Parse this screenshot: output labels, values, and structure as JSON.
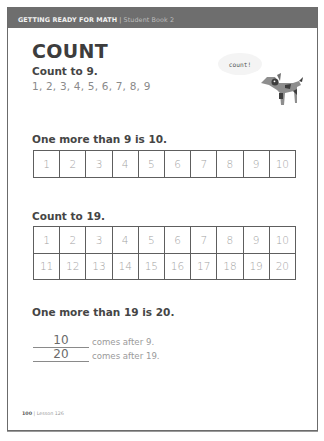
{
  "header": {
    "series": "GETTING READY FOR MATH",
    "separator": "|",
    "book": "Student Book 2"
  },
  "title": "COUNT",
  "mascot": {
    "speech": "count!",
    "icon": "dog-icon"
  },
  "sections": {
    "count_to_9": {
      "heading": "Count to 9.",
      "sequence": "1, 2, 3, 4, 5, 6, 7, 8, 9"
    },
    "one_more_9": {
      "heading": "One more than 9 is 10.",
      "grid": [
        [
          "1",
          "2",
          "3",
          "4",
          "5",
          "6",
          "7",
          "8",
          "9",
          "10"
        ]
      ]
    },
    "count_to_19": {
      "heading": "Count to 19.",
      "grid": [
        [
          "1",
          "2",
          "3",
          "4",
          "5",
          "6",
          "7",
          "8",
          "9",
          "10"
        ],
        [
          "11",
          "12",
          "13",
          "14",
          "15",
          "16",
          "17",
          "18",
          "19",
          "20"
        ]
      ]
    },
    "one_more_19": {
      "heading": "One more than 19 is 20.",
      "fills": [
        {
          "answer": "10",
          "text": "comes after 9."
        },
        {
          "answer": "20",
          "text": "comes after 19."
        }
      ]
    }
  },
  "footer": {
    "page": "100",
    "separator": "|",
    "lesson": "Lesson 126"
  }
}
